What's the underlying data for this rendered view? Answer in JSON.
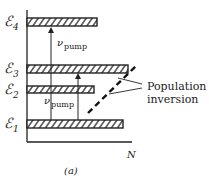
{
  "figure": {
    "caption": "(a)",
    "x_axis_label": "N",
    "levels": [
      {
        "name": "E4",
        "symbol": "ℰ",
        "subscript": "4",
        "bar_length": 70
      },
      {
        "name": "E3",
        "symbol": "ℰ",
        "subscript": "3",
        "bar_length": 101
      },
      {
        "name": "E2",
        "symbol": "ℰ",
        "subscript": "2",
        "bar_length": 67
      },
      {
        "name": "E1",
        "symbol": "ℰ",
        "subscript": "1",
        "bar_length": 96
      }
    ],
    "transitions": [
      {
        "label_nu": "ν",
        "label_sub": "pump",
        "from": "E1",
        "to": "E4"
      },
      {
        "label_nu": "ν",
        "label_sub": "pump",
        "from": "E1",
        "to": "E3"
      }
    ],
    "annotation": {
      "line1": "Population",
      "line2": "inversion"
    },
    "colors": {
      "ink": "#222222",
      "background": "#ffffff"
    }
  }
}
